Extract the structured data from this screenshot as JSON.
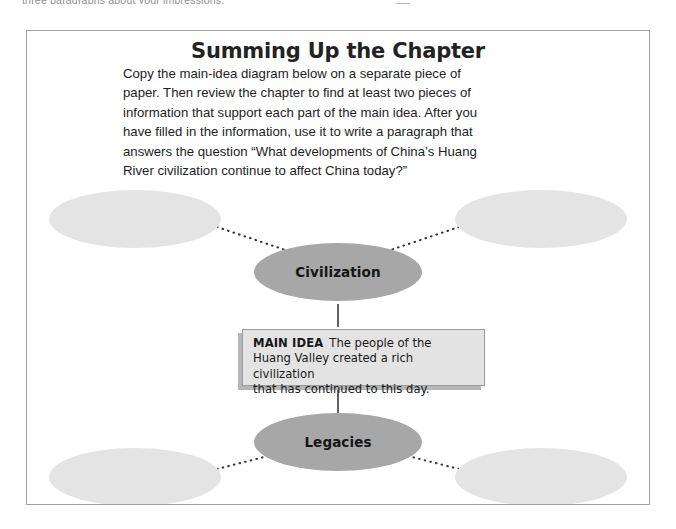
{
  "page": {
    "clipped_top_line": "three paragraphs about your impressions."
  },
  "panel": {
    "title": "Summing Up the Chapter",
    "instructions_line_1": "Copy the main-idea diagram below on a separate piece of",
    "instructions_line_2": "paper. Then review the chapter to find at least two pieces of",
    "instructions_line_3": "information that support each part of the main idea. After you",
    "instructions_line_4": "have filled in the information, use it to write a paragraph that",
    "instructions_line_5": "answers the question “What developments of China’s Huang",
    "instructions_line_6": "River civilization continue to affect China today?”"
  },
  "diagram": {
    "type": "main-idea-web",
    "center_node_top": "Civilization",
    "center_node_bottom": "Legacies",
    "main_idea_label": "MAIN IDEA",
    "main_idea_text": "The people of the Huang Valley created a rich civilization that has continued to this day.",
    "main_idea_line_1": "The people of the",
    "main_idea_line_2": "Huang Valley created a rich civilization",
    "main_idea_line_3": "that has continued to this day.",
    "blank_ovals_count": 4,
    "blank_oval_text": "",
    "colors": {
      "filled_oval": "#a7a7a7",
      "blank_oval": "#e4e4e4",
      "main_idea_fill": "#e3e3e3",
      "main_idea_shadow": "#b6b6b8",
      "connector": "#3a3a3a",
      "panel_border": "#a2a2a4"
    }
  }
}
